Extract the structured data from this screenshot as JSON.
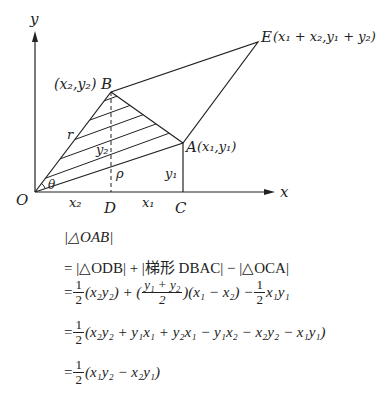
{
  "figure": {
    "axes": {
      "x_label": "x",
      "y_label": "y",
      "origin_label": "O"
    },
    "points": {
      "O": {
        "label": "O"
      },
      "A": {
        "label": "A",
        "coord": "(x₁,y₁)"
      },
      "B": {
        "label": "B",
        "coord": "(x₂,y₂)"
      },
      "C": {
        "label": "C"
      },
      "D": {
        "label": "D"
      },
      "E": {
        "label": "E",
        "coord": "(x₁ + x₂,y₁ + y₂)"
      }
    },
    "annotations": {
      "r": "r",
      "theta": "θ",
      "rho": "ρ",
      "y2": "y₂",
      "y1": "y₁",
      "x2": "x₂",
      "x1": "x₁"
    }
  },
  "equations": [
    "|△OAB|",
    "= |△ODB| + |梯形 DBAC| − |△OCA|",
    "= 1/2 (x₂y₂) + ((y₁ + y₂)/2)(x₁ − x₂) − 1/2 x₁y₁",
    "= 1/2 (x₂y₂ + y₁x₁ + y₂x₁ − y₁x₂ − x₂y₂ − x₁y₁)",
    "= 1/2 (x₁y₂ − x₂y₁)"
  ],
  "eq_parts": {
    "line1": "|△OAB|",
    "line2": "= |△ODB| + |梯形 DBAC| − |△OCA|",
    "half_num": "1",
    "half_den": "2",
    "line3_a": "= ",
    "line3_b": "(x₂y₂) + (",
    "line3_frac_num": "y₁ + y₂",
    "line3_c": ")(x₁ − x₂) − ",
    "line3_d": "x₁y₁",
    "line4_a": "= ",
    "line4_b": "(x₂y₂ + y₁x₁ + y₂x₁ − y₁x₂ − x₂y₂ − x₁y₁)",
    "line5_a": "= ",
    "line5_b": "(x₁y₂ − x₂y₁)"
  }
}
